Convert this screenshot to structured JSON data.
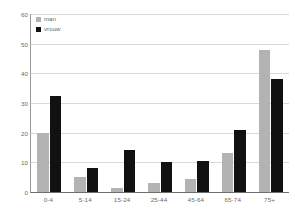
{
  "chart_data": {
    "type": "bar",
    "title": "",
    "subtitle": "",
    "xlabel": "",
    "ylabel": "",
    "categories": [
      "0-4",
      "5-14",
      "15-24",
      "25-44",
      "45-64",
      "65-74",
      "75+"
    ],
    "series": [
      {
        "name": "man",
        "color": "#b3b3b3",
        "values": [
          20,
          5,
          1.5,
          3,
          4.5,
          13,
          48
        ]
      },
      {
        "name": "vrouw",
        "color": "#111111",
        "values": [
          32.5,
          8,
          14,
          10,
          10.5,
          21,
          38
        ]
      }
    ],
    "ylim": [
      0,
      60
    ],
    "yticks": [
      0,
      10,
      20,
      30,
      40,
      50,
      60
    ],
    "ytick_labels": [
      "0",
      "10",
      "20",
      "30",
      "40",
      "50",
      "60"
    ],
    "grid": true,
    "grid_axis": "y",
    "legend_position": "top-left"
  },
  "legend": {
    "entries": [
      {
        "label": "man"
      },
      {
        "label": "vrouw"
      }
    ]
  },
  "colors": {
    "series_male": "#b3b3b3",
    "series_female": "#111111",
    "gridline": "#d9d9d9",
    "axis": "#6e6e6e",
    "tick_text": "#6b6b6b",
    "background": "#ffffff"
  }
}
